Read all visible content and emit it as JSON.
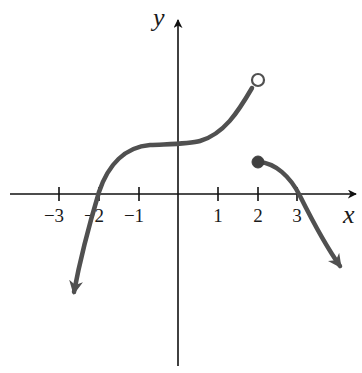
{
  "graph": {
    "axes": {
      "x_label": "x",
      "y_label": "y",
      "x_ticks": [
        {
          "value": -3,
          "label": "−3"
        },
        {
          "value": -2,
          "label": "−2"
        },
        {
          "value": -1,
          "label": "−1"
        },
        {
          "value": 1,
          "label": "1"
        },
        {
          "value": 2,
          "label": "2"
        },
        {
          "value": 3,
          "label": "3"
        }
      ]
    },
    "pieces": [
      {
        "name": "left-branch",
        "description": "cubic-like curve, continues downward to the left with an arrow, crosses x-axis near x=-2, flattens around y=1.25 at x=0, rises to open circle at (2,3)",
        "end_open_point": {
          "x": 2,
          "y": 3
        }
      },
      {
        "name": "right-branch",
        "description": "starts at closed dot at (2,1), decreases, crosses x-axis near x=3, continues downward to the right with an arrow",
        "start_closed_point": {
          "x": 2,
          "y": 1
        }
      }
    ],
    "colors": {
      "curve": "#505050",
      "axis": "#111111",
      "background": "#ffffff"
    }
  }
}
